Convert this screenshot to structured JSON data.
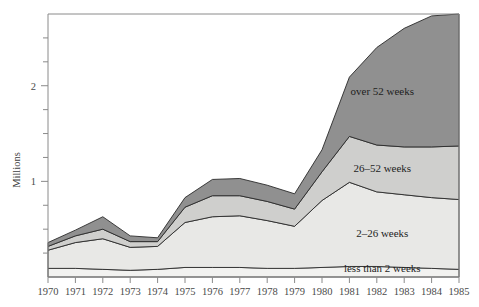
{
  "chart_data": {
    "type": "area",
    "title": "",
    "subtitle": "",
    "xlabel": "",
    "ylabel": "Millions",
    "stacked": true,
    "grid": false,
    "legend_position": "inline-annotations",
    "x": [
      1970,
      1971,
      1972,
      1973,
      1974,
      1975,
      1976,
      1977,
      1978,
      1979,
      1980,
      1981,
      1982,
      1983,
      1984,
      1985
    ],
    "categories": [
      "1970",
      "1971",
      "1972",
      "1973",
      "1974",
      "1975",
      "1976",
      "1977",
      "1978",
      "1979",
      "1980",
      "1981",
      "1982",
      "1983",
      "1984",
      "1985"
    ],
    "xlim": [
      1970,
      1985
    ],
    "ylim": [
      0,
      2.75
    ],
    "xtick_labels": [
      "1970",
      "1971",
      "1972",
      "1973",
      "1974",
      "1975",
      "1976",
      "1977",
      "1978",
      "1979",
      "1980",
      "1981",
      "1982",
      "1983",
      "1984",
      "1985"
    ],
    "ytick_major_values": [
      1,
      2
    ],
    "ytick_major_labels": [
      "1",
      "2"
    ],
    "ytick_minor_values": [
      0.25,
      0.5,
      0.75,
      1.25,
      1.5,
      1.75,
      2.25,
      2.5
    ],
    "series": [
      {
        "name": "less than 2 weeks",
        "label": "less than 2 weeks",
        "color": "#f2f2f0",
        "values": [
          0.09,
          0.09,
          0.08,
          0.07,
          0.08,
          0.1,
          0.1,
          0.1,
          0.09,
          0.09,
          0.1,
          0.11,
          0.11,
          0.1,
          0.09,
          0.08
        ]
      },
      {
        "name": "2-26 weeks",
        "label": "2–26 weeks",
        "color": "#e8e8e6",
        "values": [
          0.19,
          0.27,
          0.32,
          0.24,
          0.24,
          0.47,
          0.53,
          0.54,
          0.5,
          0.44,
          0.7,
          0.88,
          0.78,
          0.76,
          0.74,
          0.73
        ]
      },
      {
        "name": "26-52 weeks",
        "label": "26–52 weeks",
        "color": "#cfcfcd",
        "values": [
          0.04,
          0.07,
          0.1,
          0.06,
          0.05,
          0.16,
          0.22,
          0.21,
          0.2,
          0.18,
          0.3,
          0.48,
          0.49,
          0.5,
          0.53,
          0.56
        ]
      },
      {
        "name": "over 52 weeks",
        "label": "over 52 weeks",
        "color": "#909090",
        "values": [
          0.04,
          0.06,
          0.13,
          0.06,
          0.04,
          0.1,
          0.17,
          0.18,
          0.17,
          0.16,
          0.23,
          0.62,
          1.02,
          1.24,
          1.37,
          1.38
        ]
      }
    ],
    "totals": [
      0.36,
      0.49,
      0.63,
      0.43,
      0.41,
      0.83,
      1.02,
      1.03,
      0.96,
      0.87,
      1.33,
      2.09,
      2.4,
      2.6,
      2.73,
      2.75
    ],
    "annotations": [
      {
        "text": "over 52 weeks",
        "x": 1982.2,
        "y": 1.9
      },
      {
        "text": "26–52 weeks",
        "x": 1982.2,
        "y": 1.1
      },
      {
        "text": "2–26 weeks",
        "x": 1982.2,
        "y": 0.42
      },
      {
        "text": "less than 2 weeks",
        "x": 1982.2,
        "y": 0.05
      }
    ]
  },
  "axes": {
    "y_title": "Millions"
  }
}
